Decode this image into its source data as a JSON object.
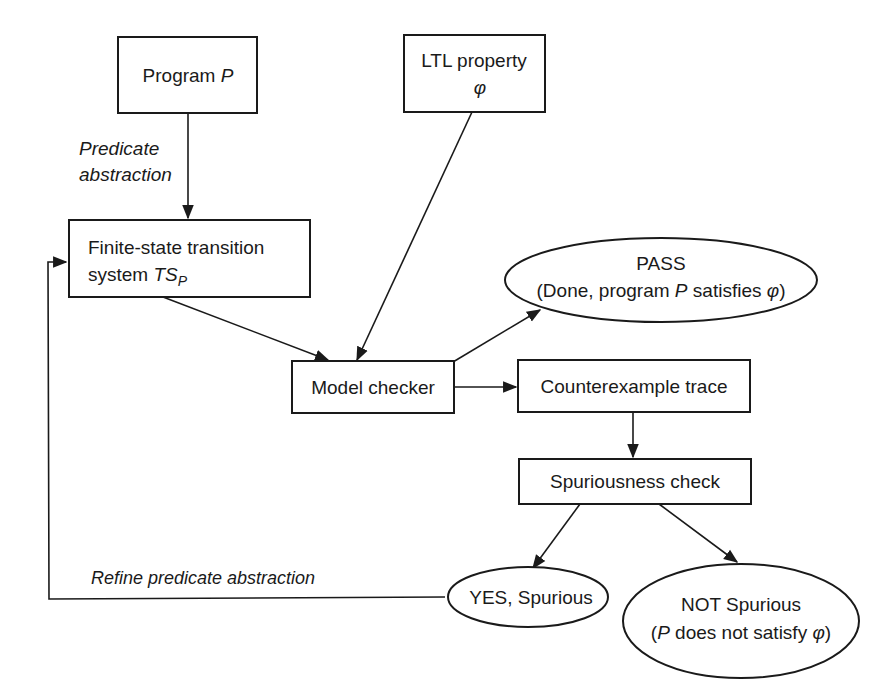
{
  "diagram": {
    "nodes": {
      "program": {
        "label_main": "Program ",
        "label_var": "P"
      },
      "ltl": {
        "line1": "LTL property",
        "line2": "φ"
      },
      "fsts": {
        "line1": "Finite-state transition",
        "line2_main": "system ",
        "line2_var": "TS",
        "line2_sub": "P"
      },
      "model_checker": {
        "label": "Model checker"
      },
      "pass": {
        "line1": "PASS",
        "line2_pre": "(Done, program ",
        "line2_var": "P",
        "line2_mid": " satisfies ",
        "line2_phi": "φ",
        "line2_post": ")"
      },
      "counterexample": {
        "label": "Counterexample trace"
      },
      "spurious_check": {
        "label": "Spuriousness check"
      },
      "yes_spurious": {
        "label": "YES, Spurious"
      },
      "not_spurious": {
        "line1": "NOT Spurious",
        "line2_pre": "(",
        "line2_var": "P",
        "line2_mid": " does not satisfy ",
        "line2_phi": "φ",
        "line2_post": ")"
      }
    },
    "edge_labels": {
      "predicate_line1": "Predicate",
      "predicate_line2": "abstraction",
      "refine": "Refine predicate abstraction"
    },
    "edges": [
      {
        "from": "program",
        "to": "fsts",
        "label": "Predicate abstraction"
      },
      {
        "from": "fsts",
        "to": "model_checker"
      },
      {
        "from": "ltl",
        "to": "model_checker"
      },
      {
        "from": "model_checker",
        "to": "pass"
      },
      {
        "from": "model_checker",
        "to": "counterexample"
      },
      {
        "from": "counterexample",
        "to": "spurious_check"
      },
      {
        "from": "spurious_check",
        "to": "yes_spurious"
      },
      {
        "from": "spurious_check",
        "to": "not_spurious"
      },
      {
        "from": "yes_spurious",
        "to": "fsts",
        "label": "Refine predicate abstraction"
      }
    ],
    "colors": {
      "stroke": "#1a1a1a",
      "background": "#ffffff"
    }
  }
}
